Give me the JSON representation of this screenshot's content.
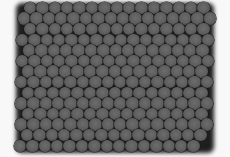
{
  "image": {
    "description": "Grayscale micrograph of hexagonally close-packed spheres",
    "background_color": "#f8f8f8",
    "sphere_color": "#606060",
    "gap_color": "#1c1c1c"
  },
  "grid": {
    "rows": 14,
    "row_spacing": 10.6,
    "col_spacing": 12.4,
    "diameter": 12.6,
    "first_row_y": 8,
    "rows_spec": [
      {
        "x0": 30,
        "count": 15
      },
      {
        "x0": 24,
        "count": 16
      },
      {
        "x0": 30,
        "count": 15
      },
      {
        "x0": 22,
        "count": 16
      },
      {
        "x0": 29,
        "count": 15
      },
      {
        "x0": 22,
        "count": 16
      },
      {
        "x0": 28,
        "count": 15
      },
      {
        "x0": 21,
        "count": 16
      },
      {
        "x0": 28,
        "count": 15
      },
      {
        "x0": 21,
        "count": 16
      },
      {
        "x0": 28,
        "count": 15
      },
      {
        "x0": 21,
        "count": 16
      },
      {
        "x0": 27,
        "count": 15
      },
      {
        "x0": 20,
        "count": 15
      }
    ]
  }
}
